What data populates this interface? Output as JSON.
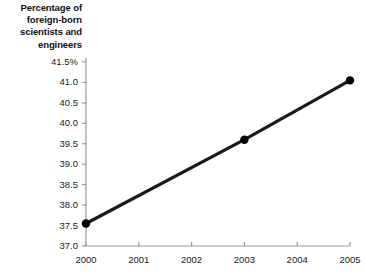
{
  "chart_data": {
    "type": "line",
    "title": "Percentage of\nforeign-born\nscientists and\nengineers",
    "xlabel": "",
    "ylabel": "",
    "x": [
      2000,
      2003,
      2005
    ],
    "values": [
      37.55,
      39.6,
      41.05
    ],
    "series": [
      {
        "name": "Percentage of foreign-born scientists and engineers",
        "x": [
          2000,
          2003,
          2005
        ],
        "values": [
          37.55,
          39.6,
          41.05
        ]
      }
    ],
    "markers": [
      {
        "x": 2000,
        "y": 37.55
      },
      {
        "x": 2003,
        "y": 39.6
      },
      {
        "x": 2005,
        "y": 41.05
      }
    ],
    "xlim": [
      2000,
      2005
    ],
    "ylim": [
      37.0,
      41.5
    ],
    "xticks": [
      2000,
      2001,
      2002,
      2003,
      2004,
      2005
    ],
    "xtick_labels": [
      "2000",
      "2001",
      "2002",
      "2003",
      "2004",
      "2005"
    ],
    "yticks": [
      41.5,
      41.0,
      40.5,
      40.0,
      39.5,
      39.0,
      38.5,
      38.0,
      37.5,
      37.0
    ],
    "ytick_labels": [
      "41.5%",
      "41.0",
      "40.5",
      "40.0",
      "39.5",
      "39.0",
      "38.5",
      "38.0",
      "37.5",
      "37.0"
    ],
    "grid": false,
    "legend": false,
    "legend_position": "none",
    "line_color": "#1a1a1a",
    "marker_color": "#000000",
    "axis_color": "#9a9a9a",
    "background_color": "#ffffff"
  }
}
